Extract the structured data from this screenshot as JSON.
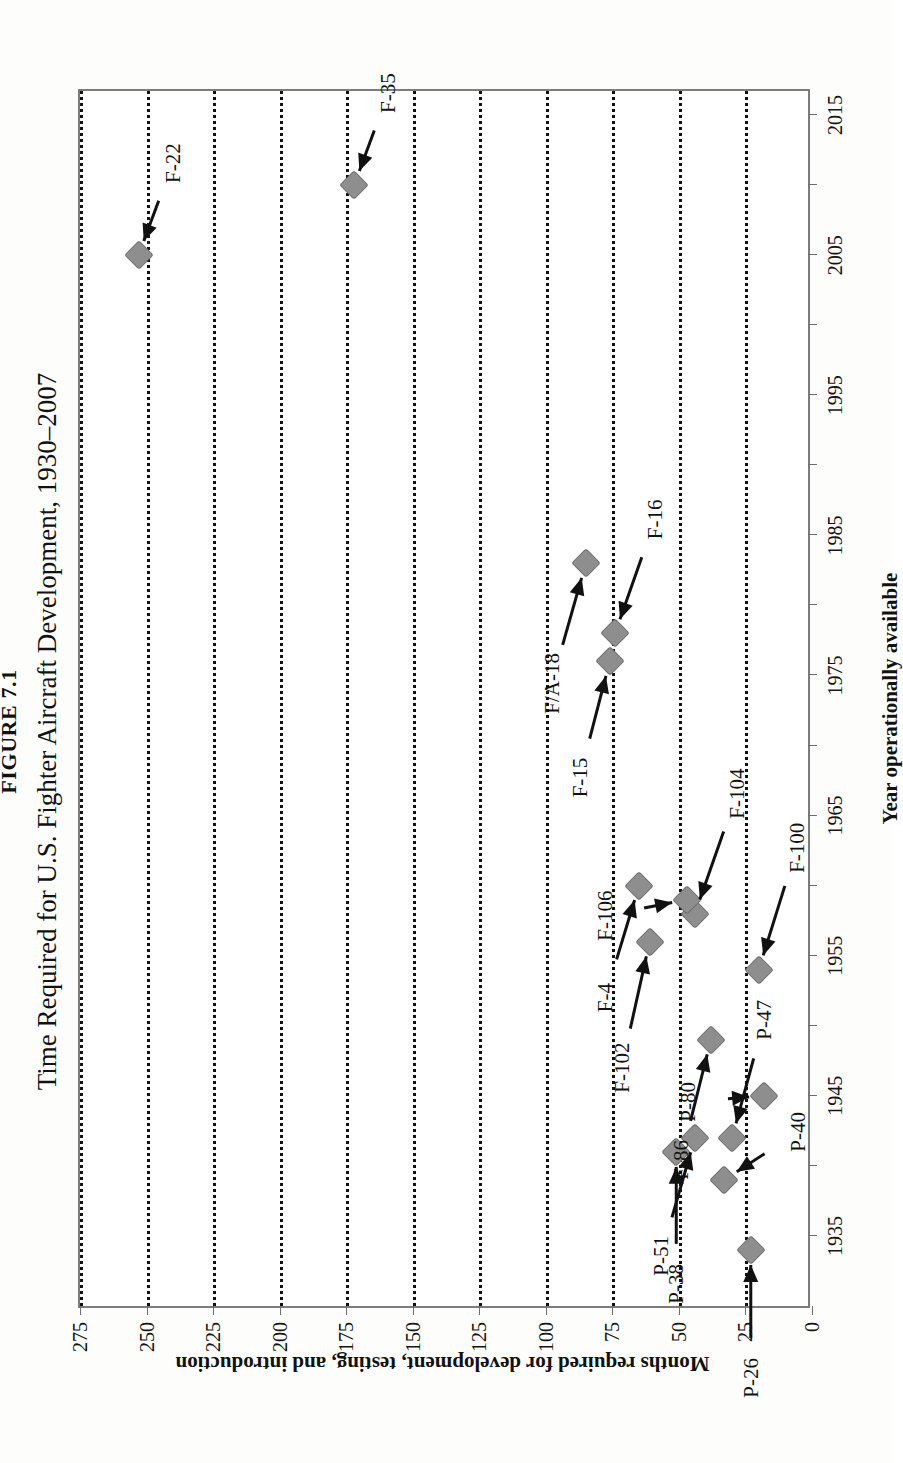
{
  "figure": {
    "number": "FIGURE 7.1",
    "title": "Time Required for U.S. Fighter Aircraft Development, 1930–2007"
  },
  "chart_data": {
    "type": "scatter",
    "title": "Time Required for U.S. Fighter Aircraft Development, 1930–2007",
    "xlabel": "Year operationally available",
    "ylabel": "Months required for development, testing, and introduction",
    "xlim": [
      1930,
      2017
    ],
    "ylim": [
      0,
      275
    ],
    "xticks": [
      1935,
      1945,
      1955,
      1965,
      1975,
      1985,
      1995,
      2005,
      2015
    ],
    "yticks": [
      0,
      25,
      50,
      75,
      100,
      125,
      150,
      175,
      200,
      225,
      250,
      275
    ],
    "grid": "horizontal-dotted",
    "legend": "none",
    "points": [
      {
        "label": "P-26",
        "x": 1934,
        "y": 23
      },
      {
        "label": "P-40",
        "x": 1939,
        "y": 33
      },
      {
        "label": "P-38",
        "x": 1941,
        "y": 51
      },
      {
        "label": "P-51",
        "x": 1942,
        "y": 44
      },
      {
        "label": "P-47",
        "x": 1942,
        "y": 30
      },
      {
        "label": "P-80",
        "x": 1945,
        "y": 18
      },
      {
        "label": "F-86",
        "x": 1949,
        "y": 38
      },
      {
        "label": "F-100",
        "x": 1954,
        "y": 20
      },
      {
        "label": "F-102",
        "x": 1956,
        "y": 61
      },
      {
        "label": "F-104",
        "x": 1958,
        "y": 44
      },
      {
        "label": "F-106",
        "x": 1959,
        "y": 47
      },
      {
        "label": "F-4",
        "x": 1960,
        "y": 65
      },
      {
        "label": "F-15",
        "x": 1976,
        "y": 76
      },
      {
        "label": "F-16",
        "x": 1978,
        "y": 74
      },
      {
        "label": "F/A-18",
        "x": 1983,
        "y": 85
      },
      {
        "label": "F-22",
        "x": 2005,
        "y": 253
      },
      {
        "label": "F-35",
        "x": 2010,
        "y": 172
      }
    ]
  },
  "labels": {
    "p26": "P-26",
    "p40": "P-40",
    "p38": "P-38",
    "p51": "P-51",
    "p47": "P-47",
    "p80": "P-80",
    "f86": "F-86",
    "f100": "F-100",
    "f102": "F-102",
    "f104": "F-104",
    "f106": "F-106",
    "f4": "F-4",
    "f15": "F-15",
    "f16": "F-16",
    "fa18": "F/A-18",
    "f22": "F-22",
    "f35": "F-35"
  },
  "yticklabels": {
    "t0": "0",
    "t25": "25",
    "t50": "50",
    "t75": "75",
    "t100": "100",
    "t125": "125",
    "t150": "150",
    "t175": "175",
    "t200": "200",
    "t225": "225",
    "t250": "250",
    "t275": "275"
  },
  "xticklabels": {
    "x1935": "1935",
    "x1945": "1945",
    "x1955": "1955",
    "x1965": "1965",
    "x1975": "1975",
    "x1985": "1985",
    "x1995": "1995",
    "x2005": "2005",
    "x2015": "2015"
  },
  "colors": {
    "marker": "#8e8e8e",
    "frame": "#7c7c7c",
    "grid": "#111111",
    "text": "#111111"
  }
}
